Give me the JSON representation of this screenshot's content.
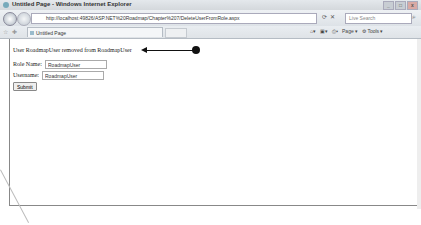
{
  "window": {
    "title": "Untitled Page - Windows Internet Explorer",
    "controls": [
      "minimize",
      "maximize",
      "close"
    ]
  },
  "address_bar": {
    "url": "http://localhost:49826/ASP.NET%20Roadmap/Chapter%207/DeleteUserFromRole.aspx",
    "search_placeholder": "Live Search"
  },
  "tab_bar": {
    "active_tab": "Untitled Page",
    "commands": {
      "page": "Page",
      "tools": "Tools"
    }
  },
  "page": {
    "status_message": "User RoadmapUser removed from RoadmapUser",
    "form": {
      "role_name_label": "Role Name:",
      "role_name_value": "RoadmapUser",
      "username_label": "Username:",
      "username_value": "RoadmapUser",
      "submit_label": "Submit"
    }
  }
}
